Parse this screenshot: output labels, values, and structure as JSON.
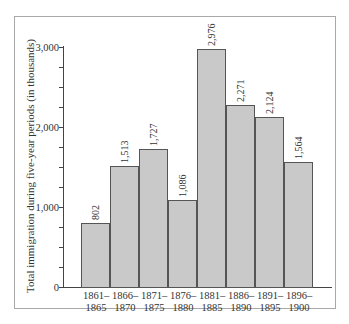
{
  "chart_data": {
    "type": "bar",
    "title": "",
    "xlabel": "",
    "ylabel": "Total immigration during five-year periods (in thousands)",
    "ylim": [
      0,
      3000
    ],
    "yticks": [
      0,
      1000,
      2000,
      3000
    ],
    "ytick_labels": [
      "0",
      "1,000",
      "2,000",
      "3,000"
    ],
    "categories": [
      "1861–1865",
      "1866–1870",
      "1871–1875",
      "1876–1880",
      "1881–1885",
      "1886–1890",
      "1891–1895",
      "1896–1900"
    ],
    "category_lines": [
      [
        "1861–",
        "1865"
      ],
      [
        "1866–",
        "1870"
      ],
      [
        "1871–",
        "1875"
      ],
      [
        "1876–",
        "1880"
      ],
      [
        "1881–",
        "1885"
      ],
      [
        "1886–",
        "1890"
      ],
      [
        "1891–",
        "1895"
      ],
      [
        "1896–",
        "1900"
      ]
    ],
    "values": [
      802,
      1513,
      1727,
      1086,
      2976,
      2271,
      2124,
      1564
    ],
    "value_labels": [
      "802",
      "1,513",
      "1,727",
      "1,086",
      "2,976",
      "2,271",
      "2,124",
      "1,564"
    ],
    "grid": false,
    "legend": null,
    "bar_color": "#c9c9c9"
  }
}
